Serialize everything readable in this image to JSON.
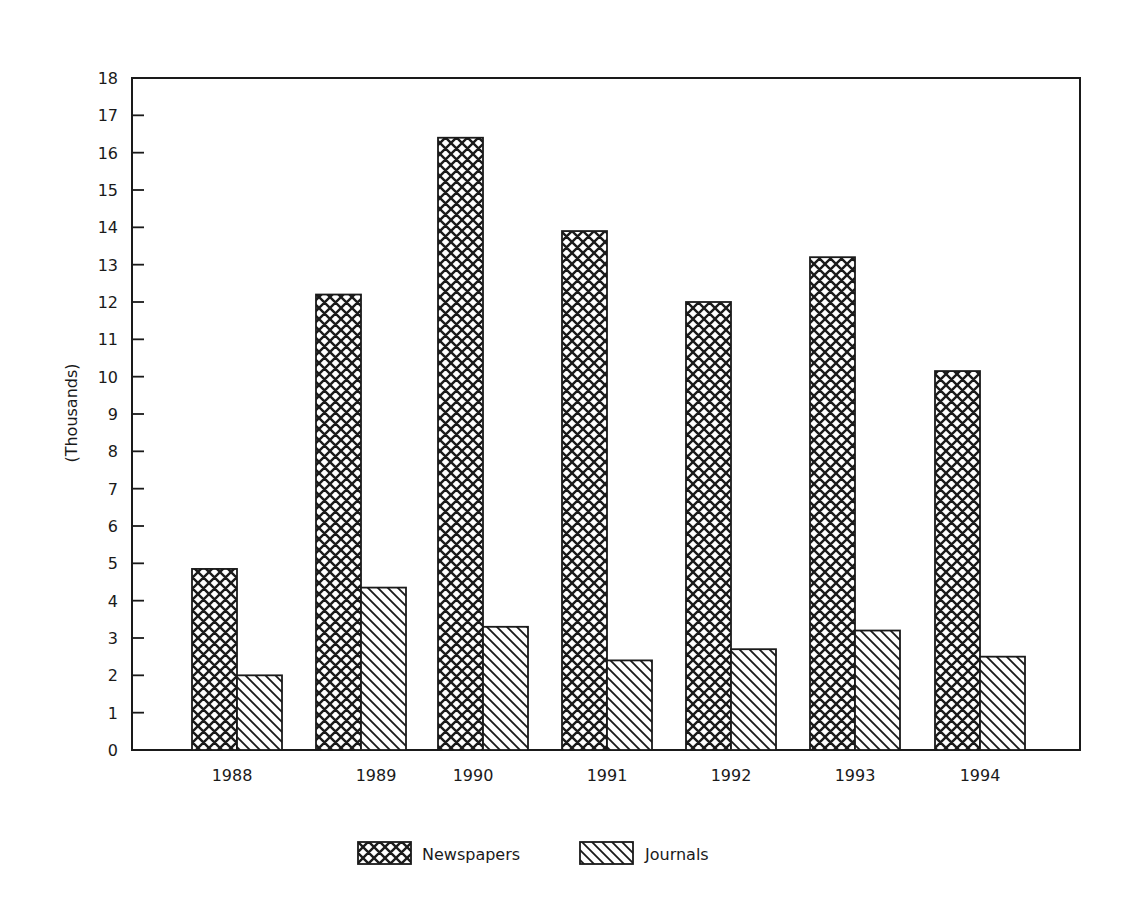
{
  "chart_data": {
    "type": "bar",
    "title": "",
    "xlabel": "",
    "ylabel": "(Thousands)",
    "ylim": [
      0,
      18
    ],
    "yticks": [
      0,
      1,
      2,
      3,
      4,
      5,
      6,
      7,
      8,
      9,
      10,
      11,
      12,
      13,
      14,
      15,
      16,
      17,
      18
    ],
    "grid": false,
    "legend_position": "bottom",
    "categories": [
      "1988",
      "1989",
      "1990",
      "1991",
      "1992",
      "1993",
      "1994"
    ],
    "series": [
      {
        "name": "Newspapers",
        "pattern": "crosshatch",
        "values": [
          4.85,
          12.2,
          16.4,
          13.9,
          12.0,
          13.2,
          10.15
        ]
      },
      {
        "name": "Journals",
        "pattern": "diagonal-hatch",
        "values": [
          2.0,
          4.35,
          3.3,
          2.4,
          2.7,
          3.2,
          2.5
        ]
      }
    ]
  },
  "colors": {
    "ink": "#1a1a1a",
    "background": "#ffffff"
  }
}
